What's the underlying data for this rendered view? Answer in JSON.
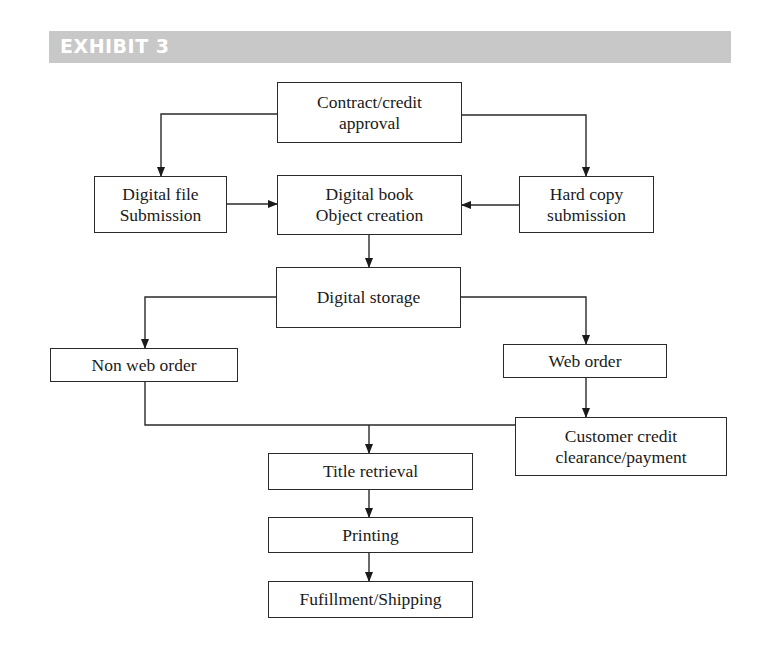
{
  "header": {
    "title": "EXHIBIT 3",
    "bg_color": "#c8c8c8"
  },
  "nodes": {
    "contract": {
      "line1": "Contract/credit",
      "line2": "approval"
    },
    "digital_file": {
      "line1": "Digital file",
      "line2": "Submission"
    },
    "digital_book": {
      "line1": "Digital book",
      "line2": "Object creation"
    },
    "hard_copy": {
      "line1": "Hard copy",
      "line2": "submission"
    },
    "digital_storage": {
      "label": "Digital storage"
    },
    "non_web_order": {
      "label": "Non web order"
    },
    "web_order": {
      "label": "Web order"
    },
    "customer_credit": {
      "line1": "Customer credit",
      "line2": "clearance/payment"
    },
    "title_retrieval": {
      "label": "Title retrieval"
    },
    "printing": {
      "label": "Printing"
    },
    "fulfillment": {
      "label": "Fufillment/Shipping"
    }
  },
  "edges": [
    {
      "from": "Contract/credit approval",
      "to": "Digital file Submission"
    },
    {
      "from": "Contract/credit approval",
      "to": "Hard copy submission"
    },
    {
      "from": "Digital file Submission",
      "to": "Digital book Object creation"
    },
    {
      "from": "Hard copy submission",
      "to": "Digital book Object creation"
    },
    {
      "from": "Digital book Object creation",
      "to": "Digital storage"
    },
    {
      "from": "Digital storage",
      "to": "Non web order"
    },
    {
      "from": "Digital storage",
      "to": "Web order"
    },
    {
      "from": "Web order",
      "to": "Customer credit clearance/payment"
    },
    {
      "from": "Non web order",
      "to": "Title retrieval"
    },
    {
      "from": "Customer credit clearance/payment",
      "to": "Title retrieval"
    },
    {
      "from": "Title retrieval",
      "to": "Printing"
    },
    {
      "from": "Printing",
      "to": "Fufillment/Shipping"
    }
  ]
}
